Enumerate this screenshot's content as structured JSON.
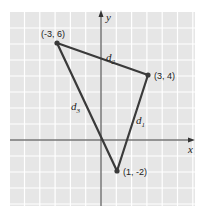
{
  "figure": {
    "axes": {
      "x_label": "x",
      "y_label": "y"
    },
    "grid": {
      "on": true,
      "background": "#e8e8e8",
      "line_color": "#ffffff"
    },
    "points": [
      {
        "label": "(-3, 6)",
        "x": -3,
        "y": 6
      },
      {
        "label": "(3, 4)",
        "x": 3,
        "y": 4
      },
      {
        "label": "(1, -2)",
        "x": 1,
        "y": -2
      }
    ],
    "segments": [
      {
        "name": "d1",
        "label": "d",
        "sub": "1",
        "from": "(3, 4)",
        "to": "(1, -2)"
      },
      {
        "name": "d2",
        "label": "d",
        "sub": "2",
        "from": "(-3, 6)",
        "to": "(3, 4)"
      },
      {
        "name": "d3",
        "label": "d",
        "sub": "3",
        "from": "(-3, 6)",
        "to": "(1, -2)"
      }
    ],
    "colors": {
      "line": "#3a3a3a",
      "point": "#3a3a3a"
    }
  }
}
